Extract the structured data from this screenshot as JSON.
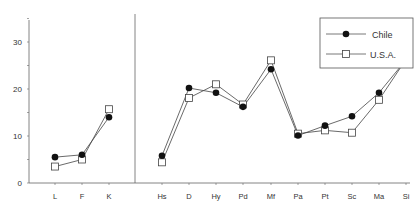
{
  "chart_data": {
    "type": "line",
    "title": "",
    "xlabel": "",
    "ylabel": "",
    "ylim": [
      0,
      35
    ],
    "yticks": [
      0,
      10,
      20,
      30
    ],
    "grid": false,
    "legend_position": "upper right",
    "panels": [
      {
        "name": "validity",
        "categories": [
          "L",
          "F",
          "K"
        ],
        "series": [
          {
            "name": "Chile",
            "marker": "filled-circle",
            "values": [
              5.5,
              6.0,
              14.0
            ]
          },
          {
            "name": "U.S.A.",
            "marker": "open-square",
            "values": [
              3.5,
              5.0,
              15.7
            ]
          }
        ]
      },
      {
        "name": "clinical",
        "categories": [
          "Hs",
          "D",
          "Hy",
          "Pd",
          "Mf",
          "Pa",
          "Pt",
          "Sc",
          "Ma",
          "Si"
        ],
        "series": [
          {
            "name": "Chile",
            "marker": "filled-circle",
            "values": [
              5.8,
              20.2,
              19.2,
              16.2,
              24.2,
              10.1,
              12.2,
              14.2,
              19.2,
              26.2
            ]
          },
          {
            "name": "U.S.A.",
            "marker": "open-square",
            "values": [
              4.4,
              18.1,
              21.0,
              16.7,
              26.1,
              10.5,
              11.2,
              10.7,
              17.7,
              26.3
            ]
          }
        ]
      }
    ],
    "legend": [
      {
        "label": "Chile",
        "marker": "filled-circle"
      },
      {
        "label": "U.S.A.",
        "marker": "open-square"
      }
    ]
  }
}
